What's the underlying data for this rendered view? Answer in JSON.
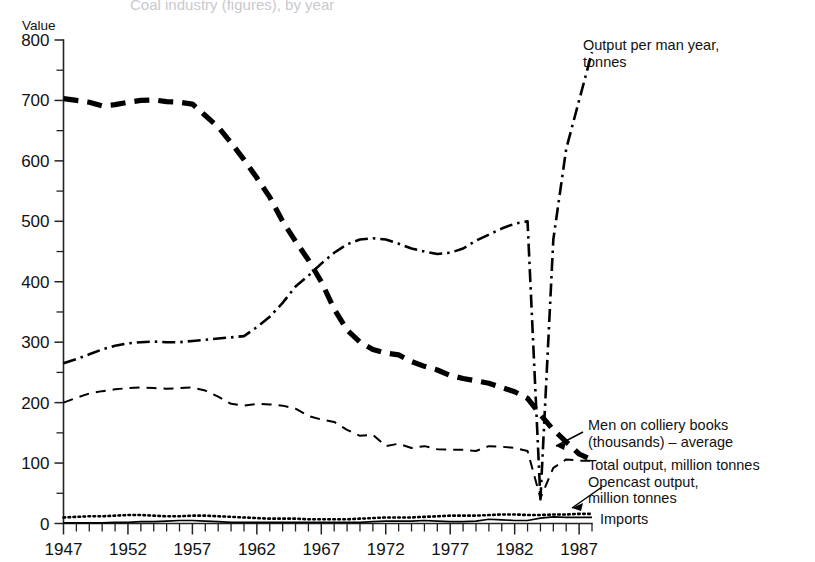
{
  "figure": {
    "cropped_title": "Coal industry (figures), by year",
    "y_axis_title": "Value"
  },
  "chart_data": {
    "type": "line",
    "title": "",
    "xlabel": "",
    "ylabel": "Value",
    "xlim": [
      1947,
      1988
    ],
    "ylim": [
      0,
      800
    ],
    "grid": false,
    "legend_position": "inline-right-annotations",
    "y_ticks_major": [
      0,
      100,
      200,
      300,
      400,
      500,
      600,
      700,
      800
    ],
    "y_ticks_minor": [
      50,
      150,
      250,
      350,
      450,
      550,
      650,
      750
    ],
    "x_tick_labels": [
      "1947",
      "1952",
      "1957",
      "1962",
      "1967",
      "1972",
      "1977",
      "1982",
      "1987"
    ],
    "x_tick_values": [
      1947,
      1952,
      1957,
      1962,
      1967,
      1972,
      1977,
      1982,
      1987
    ],
    "x_minor_every_years": 1,
    "x": [
      1947,
      1948,
      1949,
      1950,
      1951,
      1952,
      1953,
      1954,
      1955,
      1956,
      1957,
      1958,
      1959,
      1960,
      1961,
      1962,
      1963,
      1964,
      1965,
      1966,
      1967,
      1968,
      1969,
      1970,
      1971,
      1972,
      1973,
      1974,
      1975,
      1976,
      1977,
      1978,
      1979,
      1980,
      1981,
      1982,
      1983,
      1984,
      1985,
      1986,
      1987,
      1988
    ],
    "series": [
      {
        "name": "Men on colliery books (thousands) - average",
        "style": "thick-dashed",
        "label_line1": "Men on colliery books",
        "label_line2": "(thousands) – average",
        "values": [
          703,
          700,
          697,
          691,
          693,
          697,
          700,
          701,
          698,
          697,
          694,
          675,
          656,
          630,
          602,
          572,
          540,
          500,
          467,
          436,
          400,
          355,
          320,
          300,
          288,
          282,
          279,
          268,
          260,
          254,
          245,
          240,
          236,
          232,
          225,
          218,
          207,
          180,
          155,
          135,
          115,
          105
        ]
      },
      {
        "name": "Output per man year, tonnes",
        "style": "dash-dot",
        "label_line1": "Output per man year,",
        "label_line2": "tonnes",
        "values": [
          265,
          272,
          280,
          288,
          294,
          298,
          300,
          301,
          300,
          300,
          302,
          304,
          306,
          308,
          310,
          325,
          342,
          365,
          392,
          410,
          430,
          448,
          462,
          470,
          472,
          470,
          463,
          455,
          450,
          446,
          448,
          455,
          468,
          478,
          488,
          496,
          500,
          40,
          470,
          620,
          700,
          780
        ]
      },
      {
        "name": "Total output, million tonnes",
        "style": "thin-dashed",
        "label_line1": "Total output, million tonnes",
        "values": [
          200,
          208,
          215,
          219,
          222,
          224,
          225,
          224,
          223,
          224,
          225,
          220,
          210,
          198,
          195,
          198,
          197,
          195,
          190,
          178,
          172,
          168,
          155,
          145,
          147,
          128,
          132,
          125,
          128,
          123,
          122,
          122,
          120,
          128,
          127,
          125,
          120,
          42,
          92,
          106,
          104,
          104
        ]
      },
      {
        "name": "Opencast output, million tonnes",
        "style": "dotted",
        "label_line1": "Opencast output,",
        "label_line2": "million tonnes",
        "values": [
          10,
          11,
          12,
          12,
          13,
          14,
          14,
          13,
          12,
          12,
          13,
          13,
          12,
          11,
          10,
          9,
          8,
          8,
          8,
          7,
          7,
          7,
          7,
          8,
          9,
          10,
          10,
          10,
          11,
          12,
          13,
          13,
          13,
          14,
          15,
          15,
          14,
          14,
          15,
          15,
          16,
          16
        ]
      },
      {
        "name": "Imports",
        "style": "solid-thin",
        "label_line1": "Imports",
        "values": [
          1,
          1,
          1,
          1,
          2,
          2,
          3,
          3,
          4,
          5,
          5,
          4,
          3,
          2,
          2,
          2,
          2,
          2,
          2,
          2,
          2,
          2,
          2,
          2,
          3,
          4,
          4,
          4,
          5,
          4,
          3,
          3,
          4,
          7,
          6,
          5,
          5,
          9,
          11,
          10,
          10,
          10
        ]
      }
    ]
  },
  "annotations": {
    "output_per_man_year": {
      "line1": "Output per man year,",
      "line2": "tonnes"
    },
    "men_on_colliery_books": {
      "line1": "Men on colliery books",
      "line2": "(thousands) – average"
    },
    "total_output": {
      "line1": "Total output, million tonnes"
    },
    "opencast_output": {
      "line1": "Opencast output,",
      "line2": "million tonnes"
    },
    "imports": {
      "line1": "Imports"
    }
  }
}
